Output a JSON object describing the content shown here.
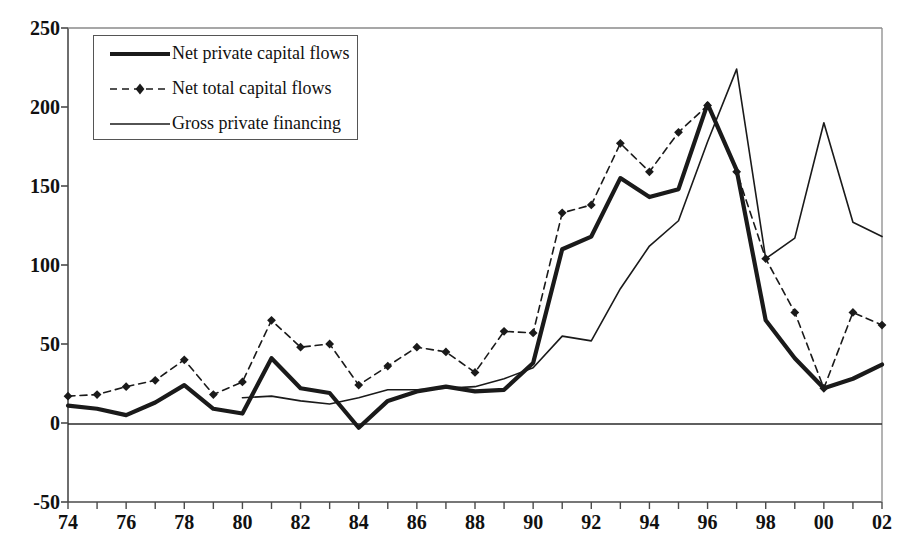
{
  "chart_data": {
    "type": "line",
    "title": "",
    "xlabel": "",
    "ylabel": "",
    "xlim": [
      74,
      102
    ],
    "ylim": [
      -50,
      250
    ],
    "ytick_step": 50,
    "xtick_step": 2,
    "grid": false,
    "legend_position": "top-left",
    "yticks": [
      "250",
      "200",
      "150",
      "100",
      "50",
      "0",
      "-50"
    ],
    "ytick_values": [
      250,
      200,
      150,
      100,
      50,
      0,
      -50
    ],
    "xticks": [
      "74",
      "76",
      "78",
      "80",
      "82",
      "84",
      "86",
      "88",
      "90",
      "92",
      "94",
      "96",
      "98",
      "00",
      "02"
    ],
    "xtick_values": [
      74,
      76,
      78,
      80,
      82,
      84,
      86,
      88,
      90,
      92,
      94,
      96,
      98,
      100,
      102
    ],
    "x": [
      74,
      75,
      76,
      77,
      78,
      79,
      80,
      81,
      82,
      83,
      84,
      85,
      86,
      87,
      88,
      89,
      90,
      91,
      92,
      93,
      94,
      95,
      96,
      97,
      98,
      99,
      100,
      101,
      102
    ],
    "series": [
      {
        "name": "Net private capital flows",
        "style": "thick-solid",
        "color": "#1a1a1a",
        "width": 4.2,
        "markers": false,
        "values": [
          11,
          9,
          5,
          13,
          24,
          9,
          6,
          41,
          22,
          19,
          -3,
          14,
          20,
          23,
          20,
          21,
          38,
          110,
          118,
          155,
          143,
          148,
          202,
          160,
          65,
          41,
          22,
          28,
          37
        ]
      },
      {
        "name": "Net total capital flows",
        "style": "dashed-diamond",
        "color": "#1a1a1a",
        "width": 1.6,
        "markers": true,
        "values": [
          17,
          18,
          23,
          27,
          40,
          18,
          26,
          65,
          48,
          50,
          24,
          36,
          48,
          45,
          32,
          58,
          57,
          133,
          138,
          177,
          159,
          184,
          201,
          159,
          104,
          70,
          22,
          70,
          62
        ]
      },
      {
        "name": "Gross private financing",
        "style": "thin-solid",
        "color": "#1a1a1a",
        "width": 1.6,
        "start_index": 6,
        "markers": false,
        "values": [
          null,
          null,
          null,
          null,
          null,
          null,
          16,
          17,
          14,
          12,
          16,
          21,
          21,
          22,
          23,
          28,
          35,
          55,
          52,
          85,
          112,
          128,
          178,
          224,
          104,
          117,
          190,
          127,
          118
        ]
      }
    ]
  },
  "legend": {
    "items": [
      {
        "label": "Net private capital flows",
        "swatch": "thick-line-swatch"
      },
      {
        "label": "Net total capital flows",
        "swatch": "dashed-diamond-swatch"
      },
      {
        "label": "Gross private financing",
        "swatch": "thin-line-swatch"
      }
    ]
  }
}
